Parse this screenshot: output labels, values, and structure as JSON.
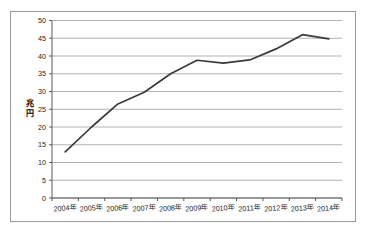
{
  "chart_data": {
    "type": "line",
    "title": "",
    "xlabel": "",
    "ylabel": "兆円",
    "categories": [
      "2004年",
      "2005年",
      "2006年",
      "2007年",
      "2008年",
      "2009年",
      "2010年",
      "2011年",
      "2012年",
      "2013年",
      "2014年"
    ],
    "values": [
      13.0,
      20.0,
      26.5,
      29.8,
      35.0,
      38.8,
      38.0,
      38.9,
      42.0,
      46.0,
      44.8
    ],
    "series": [
      {
        "name": "",
        "values": [
          13.0,
          20.0,
          26.5,
          29.8,
          35.0,
          38.8,
          38.0,
          38.9,
          42.0,
          46.0,
          44.8
        ]
      }
    ],
    "ylim": [
      0,
      50
    ],
    "yticks": [
      0,
      5,
      10,
      15,
      20,
      25,
      30,
      35,
      40,
      45,
      50
    ],
    "ytick_labels": [
      "0",
      "5",
      "10",
      "15",
      "20",
      "25",
      "30",
      "35",
      "40",
      "45",
      "50"
    ],
    "grid": true,
    "grid_axis": "y",
    "legend": false,
    "legend_position": "none",
    "markers": false,
    "line_color": "#3a3a3a",
    "grid_color": "#b3b3b3",
    "axis_color": "#595959",
    "frame_color": "#9a9a9a",
    "background_color": "#ffffff",
    "text_color": "#1c1c1c"
  }
}
